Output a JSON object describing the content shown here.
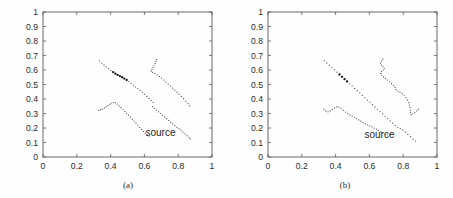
{
  "figure": {
    "background_color": "#fefefe",
    "line_color": "#4d4d4d",
    "bold_color": "#111111",
    "axis_color": "#5a5a5a",
    "text_color": "#2b2b2b"
  },
  "chart_data": [
    {
      "type": "scatter",
      "title": "",
      "subtitle": "",
      "caption": "(a)",
      "xlabel": "",
      "ylabel": "",
      "xlim": [
        0,
        1
      ],
      "ylim": [
        0,
        1
      ],
      "xticks": [
        0,
        0.2,
        0.4,
        0.6,
        0.8,
        1
      ],
      "xticklabels": [
        "0",
        "0.2",
        "0.4",
        "0.6",
        "0.8",
        "1"
      ],
      "yticks": [
        0,
        0.1,
        0.2,
        0.3,
        0.4,
        0.5,
        0.6,
        0.7,
        0.8,
        0.9,
        1
      ],
      "yticklabels": [
        "0",
        "0.1",
        "0.2",
        "0.3",
        "0.4",
        "0.5",
        "0.6",
        "0.7",
        "0.8",
        "0.9",
        "1"
      ],
      "grid": false,
      "legend": false,
      "annotations": [
        {
          "text": "source",
          "x": 0.695,
          "y": 0.145
        }
      ],
      "series": [
        {
          "name": "trajectory-1-upper-diagonal",
          "style": "dotted",
          "points": [
            [
              0.333,
              0.663
            ],
            [
              0.347,
              0.648
            ],
            [
              0.361,
              0.635
            ],
            [
              0.374,
              0.622
            ],
            [
              0.388,
              0.609
            ],
            [
              0.401,
              0.597
            ],
            [
              0.415,
              0.586
            ],
            [
              0.428,
              0.575
            ],
            [
              0.441,
              0.566
            ],
            [
              0.455,
              0.558
            ],
            [
              0.468,
              0.55
            ],
            [
              0.481,
              0.541
            ],
            [
              0.495,
              0.531
            ],
            [
              0.508,
              0.52
            ],
            [
              0.521,
              0.508
            ],
            [
              0.535,
              0.496
            ],
            [
              0.548,
              0.484
            ],
            [
              0.561,
              0.472
            ],
            [
              0.575,
              0.459
            ],
            [
              0.588,
              0.446
            ],
            [
              0.601,
              0.432
            ],
            [
              0.614,
              0.418
            ],
            [
              0.627,
              0.404
            ],
            [
              0.64,
              0.39
            ],
            [
              0.652,
              0.376
            ]
          ],
          "bold_span": [
            0.415,
            0.495
          ]
        },
        {
          "name": "trajectory-2-lower-left-hump",
          "style": "dotted",
          "points": [
            [
              0.33,
              0.322
            ],
            [
              0.341,
              0.326
            ],
            [
              0.352,
              0.331
            ],
            [
              0.363,
              0.338
            ],
            [
              0.374,
              0.346
            ],
            [
              0.385,
              0.355
            ],
            [
              0.396,
              0.364
            ],
            [
              0.407,
              0.372
            ],
            [
              0.418,
              0.377
            ],
            [
              0.429,
              0.374
            ],
            [
              0.44,
              0.365
            ],
            [
              0.451,
              0.353
            ],
            [
              0.462,
              0.34
            ],
            [
              0.473,
              0.327
            ],
            [
              0.484,
              0.314
            ],
            [
              0.495,
              0.301
            ],
            [
              0.506,
              0.288
            ],
            [
              0.517,
              0.275
            ],
            [
              0.528,
              0.261
            ],
            [
              0.539,
              0.247
            ],
            [
              0.55,
              0.233
            ],
            [
              0.561,
              0.219
            ],
            [
              0.572,
              0.205
            ],
            [
              0.583,
              0.191
            ],
            [
              0.594,
              0.177
            ],
            [
              0.605,
              0.163
            ],
            [
              0.616,
              0.152
            ],
            [
              0.627,
              0.144
            ]
          ],
          "bold_span": null
        },
        {
          "name": "trajectory-3-upper-right-hook",
          "style": "dotted",
          "points": [
            [
              0.672,
              0.672
            ],
            [
              0.668,
              0.659
            ],
            [
              0.663,
              0.645
            ],
            [
              0.657,
              0.631
            ],
            [
              0.651,
              0.618
            ],
            [
              0.645,
              0.605
            ],
            [
              0.64,
              0.592
            ],
            [
              0.648,
              0.584
            ],
            [
              0.661,
              0.576
            ],
            [
              0.675,
              0.567
            ],
            [
              0.689,
              0.556
            ],
            [
              0.702,
              0.544
            ],
            [
              0.715,
              0.531
            ],
            [
              0.728,
              0.517
            ],
            [
              0.741,
              0.503
            ],
            [
              0.754,
              0.489
            ],
            [
              0.767,
              0.475
            ],
            [
              0.78,
              0.461
            ],
            [
              0.793,
              0.447
            ],
            [
              0.806,
              0.433
            ],
            [
              0.819,
              0.418
            ],
            [
              0.832,
              0.402
            ],
            [
              0.845,
              0.385
            ],
            [
              0.858,
              0.368
            ],
            [
              0.868,
              0.353
            ]
          ],
          "bold_span": null
        },
        {
          "name": "trajectory-4-lower-right-descending",
          "style": "dotted",
          "points": [
            [
              0.648,
              0.348
            ],
            [
              0.66,
              0.336
            ],
            [
              0.672,
              0.324
            ],
            [
              0.684,
              0.312
            ],
            [
              0.696,
              0.3
            ],
            [
              0.708,
              0.288
            ],
            [
              0.72,
              0.276
            ],
            [
              0.732,
              0.264
            ],
            [
              0.744,
              0.252
            ],
            [
              0.756,
              0.24
            ],
            [
              0.768,
              0.228
            ],
            [
              0.78,
              0.216
            ],
            [
              0.792,
              0.205
            ],
            [
              0.804,
              0.196
            ],
            [
              0.816,
              0.185
            ],
            [
              0.828,
              0.172
            ],
            [
              0.84,
              0.16
            ],
            [
              0.852,
              0.147
            ],
            [
              0.864,
              0.134
            ],
            [
              0.872,
              0.125
            ]
          ],
          "bold_span": null
        }
      ]
    },
    {
      "type": "scatter",
      "title": "",
      "subtitle": "",
      "caption": "(b)",
      "xlabel": "",
      "ylabel": "",
      "xlim": [
        0,
        1
      ],
      "ylim": [
        0,
        1
      ],
      "xticks": [
        0,
        0.2,
        0.4,
        0.6,
        0.8,
        1
      ],
      "xticklabels": [
        "0",
        "0.2",
        "0.4",
        "0.6",
        "0.8",
        "1"
      ],
      "yticks": [
        0,
        0.1,
        0.2,
        0.3,
        0.4,
        0.5,
        0.6,
        0.7,
        0.8,
        0.9,
        1
      ],
      "yticklabels": [
        "0",
        "0.1",
        "0.2",
        "0.3",
        "0.4",
        "0.5",
        "0.6",
        "0.7",
        "0.8",
        "0.9",
        "1"
      ],
      "grid": false,
      "legend": false,
      "annotations": [
        {
          "text": "source",
          "x": 0.66,
          "y": 0.13
        }
      ],
      "series": [
        {
          "name": "trajectory-1-long-diagonal",
          "style": "dotted",
          "points": [
            [
              0.333,
              0.665
            ],
            [
              0.348,
              0.649
            ],
            [
              0.363,
              0.633
            ],
            [
              0.378,
              0.617
            ],
            [
              0.393,
              0.601
            ],
            [
              0.408,
              0.585
            ],
            [
              0.423,
              0.569
            ],
            [
              0.438,
              0.553
            ],
            [
              0.453,
              0.537
            ],
            [
              0.468,
              0.521
            ],
            [
              0.483,
              0.505
            ],
            [
              0.498,
              0.489
            ],
            [
              0.513,
              0.473
            ],
            [
              0.528,
              0.457
            ],
            [
              0.543,
              0.441
            ],
            [
              0.558,
              0.425
            ],
            [
              0.573,
              0.409
            ],
            [
              0.588,
              0.393
            ],
            [
              0.603,
              0.377
            ],
            [
              0.618,
              0.361
            ],
            [
              0.633,
              0.345
            ],
            [
              0.648,
              0.329
            ],
            [
              0.663,
              0.313
            ],
            [
              0.678,
              0.297
            ],
            [
              0.693,
              0.281
            ],
            [
              0.708,
              0.265
            ],
            [
              0.723,
              0.249
            ],
            [
              0.738,
              0.233
            ],
            [
              0.753,
              0.217
            ],
            [
              0.768,
              0.205
            ],
            [
              0.783,
              0.196
            ],
            [
              0.798,
              0.187
            ],
            [
              0.813,
              0.172
            ],
            [
              0.828,
              0.156
            ],
            [
              0.843,
              0.14
            ],
            [
              0.858,
              0.124
            ],
            [
              0.873,
              0.11
            ]
          ],
          "bold_span": [
            0.423,
            0.468
          ]
        },
        {
          "name": "trajectory-2-lower-left-hump",
          "style": "dotted",
          "points": [
            [
              0.33,
              0.33
            ],
            [
              0.342,
              0.318
            ],
            [
              0.355,
              0.312
            ],
            [
              0.368,
              0.318
            ],
            [
              0.381,
              0.328
            ],
            [
              0.394,
              0.338
            ],
            [
              0.407,
              0.345
            ],
            [
              0.42,
              0.344
            ],
            [
              0.433,
              0.334
            ],
            [
              0.446,
              0.322
            ],
            [
              0.459,
              0.31
            ],
            [
              0.472,
              0.299
            ],
            [
              0.485,
              0.29
            ],
            [
              0.498,
              0.282
            ],
            [
              0.511,
              0.274
            ],
            [
              0.524,
              0.265
            ],
            [
              0.537,
              0.256
            ],
            [
              0.55,
              0.247
            ],
            [
              0.563,
              0.238
            ],
            [
              0.576,
              0.23
            ],
            [
              0.589,
              0.222
            ],
            [
              0.602,
              0.215
            ],
            [
              0.615,
              0.208
            ],
            [
              0.628,
              0.2
            ],
            [
              0.641,
              0.192
            ],
            [
              0.654,
              0.183
            ],
            [
              0.667,
              0.174
            ],
            [
              0.68,
              0.166
            ],
            [
              0.693,
              0.158
            ],
            [
              0.706,
              0.153
            ],
            [
              0.719,
              0.151
            ],
            [
              0.726,
              0.158
            ]
          ],
          "bold_span": null
        },
        {
          "name": "trajectory-3-upper-right-zigzag",
          "style": "dotted",
          "points": [
            [
              0.68,
              0.675
            ],
            [
              0.673,
              0.661
            ],
            [
              0.666,
              0.647
            ],
            [
              0.671,
              0.634
            ],
            [
              0.681,
              0.624
            ],
            [
              0.688,
              0.612
            ],
            [
              0.682,
              0.6
            ],
            [
              0.673,
              0.589
            ],
            [
              0.668,
              0.576
            ],
            [
              0.673,
              0.563
            ],
            [
              0.683,
              0.552
            ],
            [
              0.695,
              0.542
            ],
            [
              0.707,
              0.531
            ],
            [
              0.719,
              0.519
            ],
            [
              0.731,
              0.506
            ],
            [
              0.743,
              0.493
            ],
            [
              0.752,
              0.48
            ],
            [
              0.757,
              0.466
            ],
            [
              0.768,
              0.455
            ],
            [
              0.781,
              0.447
            ],
            [
              0.794,
              0.437
            ],
            [
              0.806,
              0.424
            ],
            [
              0.817,
              0.409
            ],
            [
              0.826,
              0.392
            ],
            [
              0.833,
              0.375
            ],
            [
              0.838,
              0.358
            ],
            [
              0.841,
              0.341
            ],
            [
              0.843,
              0.324
            ],
            [
              0.844,
              0.307
            ],
            [
              0.846,
              0.292
            ],
            [
              0.856,
              0.298
            ],
            [
              0.868,
              0.308
            ],
            [
              0.88,
              0.318
            ],
            [
              0.89,
              0.33
            ]
          ],
          "bold_span": null
        }
      ]
    }
  ],
  "panels": [
    {
      "id": "panel-a",
      "caption": "(a)",
      "source_label": "source"
    },
    {
      "id": "panel-b",
      "caption": "(b)",
      "source_label": "source"
    }
  ]
}
